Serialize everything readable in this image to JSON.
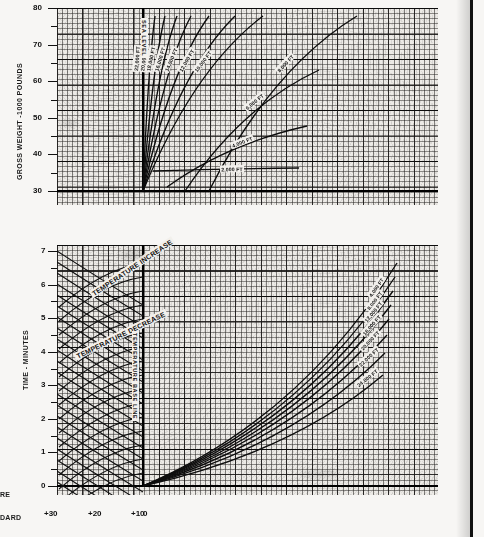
{
  "document": {
    "kind": "aviation-performance-nomograph",
    "margin_text_upper": "RE",
    "margin_text_lower": "DARD"
  },
  "upper_chart": {
    "y_axis_label": "GROSS WEIGHT -1000 POUNDS",
    "y_ticks": [
      "80",
      "70",
      "60",
      "50",
      "40",
      "30"
    ],
    "y_values": [
      80,
      70,
      60,
      50,
      40,
      30
    ],
    "baseline_label": "SEA LEVEL",
    "curve_labels": [
      "2,000 FT",
      "4,000 FT",
      "6,000 FT",
      "8,000 FT",
      "10,000 FT",
      "12,000 FT",
      "14,000 FT",
      "16,000 FT",
      "18,000 FT",
      "20,000 FT",
      "22,000 FT"
    ]
  },
  "lower_chart": {
    "y_axis_label": "TIME - MINUTES",
    "y_ticks": [
      "7",
      "6",
      "5",
      "4",
      "3",
      "2",
      "1",
      "0"
    ],
    "y_values": [
      7,
      6,
      5,
      4,
      3,
      2,
      1,
      0
    ],
    "baseline_label": "TEMPERATURE BASE LINE",
    "left_fan_labels": [
      "TEMPERATURE INCREASE",
      "TEMPERATURE DECREASE"
    ],
    "right_curve_labels": [
      "SL",
      "4,000 FT",
      "8,000 FT",
      "12,000 FT",
      "16,000 FT",
      "20,000 FT",
      "22,000 FT",
      "24,000 FT"
    ]
  },
  "x_axis": {
    "ticks": [
      "+30",
      "+20",
      "+10",
      "0"
    ],
    "values": [
      30,
      20,
      10,
      0
    ]
  },
  "chart_data": {
    "type": "line",
    "panels": [
      {
        "name": "upper",
        "ylabel": "GROSS WEIGHT -1000 POUNDS",
        "ylim": [
          28,
          80
        ],
        "xlabel": "",
        "grid": true,
        "origin_note": "fan radiates from SEA LEVEL baseline",
        "series": [
          {
            "name": "2,000 FT",
            "points": [
              [
                0,
                30
              ],
              [
                62,
                31.5
              ],
              [
                100,
                33
              ]
            ]
          },
          {
            "name": "4,000 FT",
            "points": [
              [
                0,
                30
              ],
              [
                58,
                34
              ],
              [
                96,
                38
              ]
            ]
          },
          {
            "name": "6,000 FT",
            "points": [
              [
                0,
                30
              ],
              [
                52,
                38
              ],
              [
                88,
                46
              ]
            ]
          },
          {
            "name": "8,000 FT",
            "points": [
              [
                0,
                30
              ],
              [
                44,
                43
              ],
              [
                76,
                55
              ]
            ]
          },
          {
            "name": "10,000 FT",
            "points": [
              [
                0,
                30
              ],
              [
                36,
                47
              ],
              [
                62,
                62
              ]
            ]
          },
          {
            "name": "12,000 FT",
            "points": [
              [
                0,
                30
              ],
              [
                28,
                50
              ],
              [
                50,
                69
              ]
            ]
          },
          {
            "name": "14,000 FT",
            "points": [
              [
                0,
                30
              ],
              [
                22,
                53
              ],
              [
                40,
                74
              ]
            ]
          },
          {
            "name": "16,000 FT",
            "points": [
              [
                0,
                30
              ],
              [
                17,
                55
              ],
              [
                31,
                77
              ]
            ]
          },
          {
            "name": "18,000 FT",
            "points": [
              [
                0,
                30
              ],
              [
                12,
                56
              ],
              [
                22,
                79
              ]
            ]
          },
          {
            "name": "20,000 FT",
            "points": [
              [
                0,
                30
              ],
              [
                8,
                57
              ],
              [
                14,
                80
              ]
            ]
          },
          {
            "name": "22,000 FT",
            "points": [
              [
                0,
                30
              ],
              [
                4,
                57
              ],
              [
                7,
                80
              ]
            ]
          }
        ]
      },
      {
        "name": "lower_right",
        "ylabel": "TIME - MINUTES",
        "ylim": [
          0,
          7
        ],
        "grid": true,
        "origin_note": "fan radiates from origin at temperature base line",
        "series": [
          {
            "name": "SL",
            "points": [
              [
                0,
                0
              ],
              [
                50,
                2.6
              ],
              [
                100,
                6.7
              ]
            ]
          },
          {
            "name": "4,000 FT",
            "points": [
              [
                0,
                0
              ],
              [
                50,
                2.3
              ],
              [
                100,
                6.0
              ]
            ]
          },
          {
            "name": "8,000 FT",
            "points": [
              [
                0,
                0
              ],
              [
                50,
                2.0
              ],
              [
                100,
                5.3
              ]
            ]
          },
          {
            "name": "12,000 FT",
            "points": [
              [
                0,
                0
              ],
              [
                50,
                1.75
              ],
              [
                100,
                4.6
              ]
            ]
          },
          {
            "name": "16,000 FT",
            "points": [
              [
                0,
                0
              ],
              [
                50,
                1.5
              ],
              [
                100,
                4.0
              ]
            ]
          },
          {
            "name": "20,000 FT",
            "points": [
              [
                0,
                0
              ],
              [
                50,
                1.25
              ],
              [
                100,
                3.4
              ]
            ]
          },
          {
            "name": "22,000 FT",
            "points": [
              [
                0,
                0
              ],
              [
                50,
                1.05
              ],
              [
                100,
                2.8
              ]
            ]
          },
          {
            "name": "24,000 FT",
            "points": [
              [
                0,
                0
              ],
              [
                50,
                0.85
              ],
              [
                100,
                2.2
              ]
            ]
          }
        ]
      },
      {
        "name": "lower_left",
        "ylabel": "TIME - MINUTES",
        "xlabel_ticks": [
          "+30",
          "+20",
          "+10",
          "0"
        ],
        "grid": true,
        "origin_note": "dense cross fan of temperature correction lines",
        "annotations": [
          "TEMPERATURE INCREASE",
          "TEMPERATURE DECREASE"
        ]
      }
    ]
  }
}
